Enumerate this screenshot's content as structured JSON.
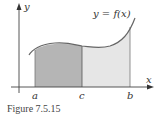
{
  "figure": {
    "caption": "Figure 7.5.15",
    "curve_label": "y = f(x)",
    "axes": {
      "x_label": "x",
      "y_label": "y"
    },
    "ticks": [
      {
        "label": "a"
      },
      {
        "label": "c"
      },
      {
        "label": "b"
      }
    ],
    "regions": [
      {
        "name": "a-to-c",
        "fill": "#b5b5b5"
      },
      {
        "name": "c-to-b",
        "fill": "#e6e6e6"
      }
    ],
    "colors": {
      "axis": "#444444",
      "curve": "#666666",
      "dark_region": "#b5b5b5",
      "light_region": "#e6e6e6"
    }
  }
}
